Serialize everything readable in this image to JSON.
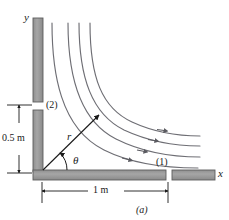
{
  "figure": {
    "caption": "(a)",
    "axes": {
      "y_label": "y",
      "x_label": "x"
    },
    "ports": {
      "inlet_label": "(1)",
      "outlet_label": "(2)"
    },
    "dimensions": {
      "vertical_label": "0.5 m",
      "horizontal_label": "1 m"
    },
    "polar": {
      "radius_label": "r",
      "angle_label": "θ"
    },
    "colors": {
      "wall_fill": "#9b9b9b",
      "wall_stroke": "#5d5d5d",
      "streamline": "#6e6e74",
      "ink": "#1a1a1a"
    },
    "walls": [
      {
        "name": "vertical-wall-upper",
        "x": 33,
        "y": 18,
        "w": 10,
        "h": 84
      },
      {
        "name": "vertical-wall-lower",
        "x": 33,
        "y": 110,
        "w": 10,
        "h": 62
      },
      {
        "name": "horizontal-wall-inner",
        "x": 33,
        "y": 170,
        "w": 133,
        "h": 10
      },
      {
        "name": "horizontal-wall-outer",
        "x": 172,
        "y": 170,
        "w": 43,
        "h": 10
      }
    ],
    "streamlines": [
      {
        "name": "streamline-1",
        "path": "M 52,23 C 52,72 60,128 104,150 C 136,166 172,168 198,168",
        "arrow_t": 0.56
      },
      {
        "name": "streamline-2",
        "path": "M 68,23 C 68,76 80,121 116,139 C 146,154 178,157 200,157",
        "arrow_t": 0.56
      },
      {
        "name": "streamline-3",
        "path": "M 79,23 C 79,78 92,114 124,130 C 152,143 180,146 200,146",
        "arrow_t": 0.56
      },
      {
        "name": "streamline-4",
        "path": "M 90,23 C 90,78 102,108 132,122 C 158,134 182,136 200,136",
        "arrow_t": 0.56
      }
    ]
  }
}
